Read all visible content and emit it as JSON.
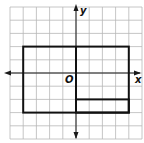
{
  "diagram": {
    "type": "coordinate-grid",
    "grid": {
      "x_min": -5,
      "x_max": 5,
      "y_min": -5,
      "y_max": 5,
      "cell_px": 13.2,
      "origin_px": [
        74,
        73
      ],
      "line_color": "#b8b8b8"
    },
    "axes": {
      "x_label": "x",
      "y_label": "y",
      "origin_label": "O",
      "color": "#1a1a1a"
    },
    "outer_rectangle": {
      "x1": -4,
      "y1": 2,
      "x2": 4,
      "y2": -3
    },
    "inner_rectangle": {
      "x1": 0,
      "y1": -2,
      "x2": 4,
      "y2": -3
    },
    "vertical_segment": {
      "x": 0,
      "y1": 2,
      "y2": -2
    },
    "shape_color": "#111111"
  }
}
